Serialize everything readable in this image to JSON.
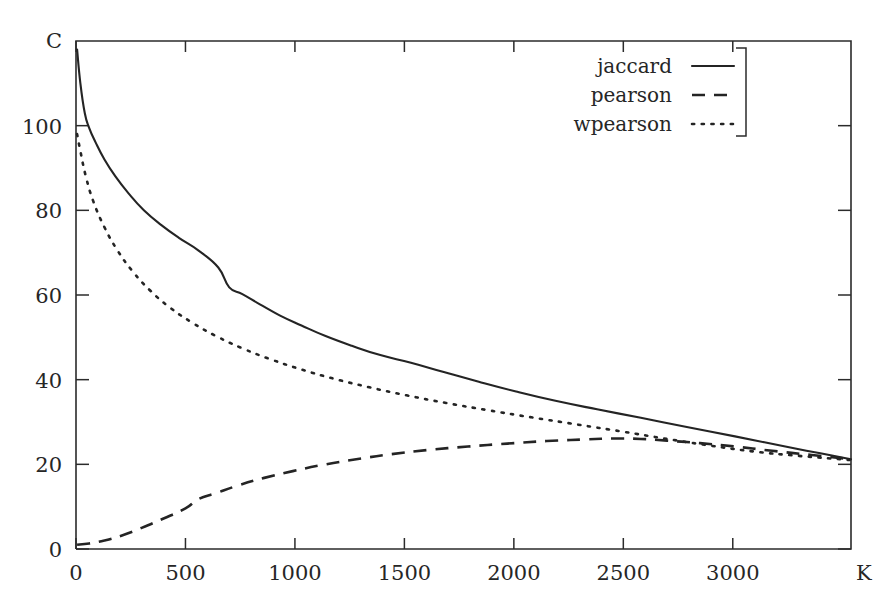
{
  "chart_data": {
    "type": "line",
    "title": "",
    "subtitle": "",
    "xlabel": "K",
    "ylabel": "C",
    "xlim": [
      0,
      3540
    ],
    "ylim": [
      0,
      120
    ],
    "xticks": [
      0,
      500,
      1000,
      1500,
      2000,
      2500,
      3000
    ],
    "xticklabels": [
      "0",
      "500",
      "1000",
      "1500",
      "2000",
      "2500",
      "3000"
    ],
    "yticks": [
      0,
      20,
      40,
      60,
      80,
      100
    ],
    "yticklabels": [
      "0",
      "20",
      "40",
      "60",
      "80",
      "100"
    ],
    "grid": false,
    "legend_position": "top-right",
    "legend_entries": [
      "jaccard",
      "pearson",
      "wpearson"
    ],
    "series": [
      {
        "name": "jaccard",
        "style": "solid",
        "x": [
          5,
          20,
          40,
          60,
          90,
          130,
          180,
          240,
          310,
          390,
          470,
          560,
          650,
          700,
          760,
          840,
          930,
          1030,
          1140,
          1260,
          1390,
          1530,
          1680,
          1840,
          2010,
          2190,
          2380,
          2580,
          2790,
          3010,
          3240,
          3400,
          3540
        ],
        "values": [
          118,
          110,
          103,
          99.5,
          96,
          92,
          88,
          84,
          80,
          76.5,
          73.5,
          70.5,
          66.5,
          61.8,
          60.2,
          57.8,
          55.2,
          52.8,
          50.3,
          48.0,
          45.8,
          44.0,
          41.8,
          39.5,
          37.2,
          35.0,
          33.0,
          31.0,
          28.8,
          26.6,
          24.2,
          22.6,
          21.2
        ]
      },
      {
        "name": "pearson",
        "style": "dashed",
        "x": [
          5,
          60,
          130,
          210,
          300,
          400,
          500,
          560,
          640,
          740,
          860,
          990,
          1130,
          1280,
          1440,
          1610,
          1790,
          1970,
          2150,
          2330,
          2450,
          2580,
          2700,
          2850,
          3010,
          3180,
          3360,
          3540
        ],
        "values": [
          1.0,
          1.3,
          2.0,
          3.2,
          5.0,
          7.2,
          9.6,
          11.8,
          13.2,
          15.0,
          16.8,
          18.4,
          19.9,
          21.2,
          22.4,
          23.4,
          24.2,
          24.9,
          25.5,
          25.9,
          26.1,
          26.0,
          25.6,
          25.0,
          24.2,
          23.2,
          22.2,
          21.2
        ]
      },
      {
        "name": "wpearson",
        "style": "dotted",
        "x": [
          5,
          20,
          45,
          80,
          130,
          190,
          260,
          340,
          430,
          530,
          640,
          760,
          890,
          1030,
          1180,
          1340,
          1510,
          1690,
          1880,
          2080,
          2290,
          2500,
          2700,
          2900,
          3100,
          3300,
          3540
        ],
        "values": [
          98,
          94,
          88,
          82,
          76,
          70.5,
          65.5,
          61.0,
          57.0,
          53.5,
          50.3,
          47.4,
          44.8,
          42.4,
          40.2,
          38.2,
          36.3,
          34.5,
          32.8,
          31.1,
          29.4,
          27.7,
          26.0,
          24.4,
          23.0,
          22.0,
          21.0
        ]
      }
    ]
  },
  "axes": {
    "y_axis_name": "C",
    "x_axis_name": "K"
  },
  "legend": {
    "items": [
      {
        "label": "jaccard",
        "style": "solid"
      },
      {
        "label": "pearson",
        "style": "dashed"
      },
      {
        "label": "wpearson",
        "style": "dotted"
      }
    ]
  },
  "colors": {
    "ink": "#242424",
    "background": "#ffffff"
  }
}
